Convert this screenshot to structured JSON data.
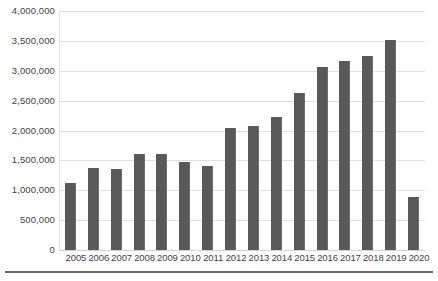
{
  "chart_data": {
    "type": "bar",
    "title": "",
    "subtitle": "",
    "xlabel": "",
    "ylabel": "",
    "categories": [
      "2005",
      "2006",
      "2007",
      "2008",
      "2009",
      "2010",
      "2011",
      "2012",
      "2013",
      "2014",
      "2015",
      "2016",
      "2017",
      "2018",
      "2019",
      "2020"
    ],
    "values": [
      1120000,
      1380000,
      1360000,
      1610000,
      1600000,
      1480000,
      1400000,
      2050000,
      2080000,
      2220000,
      2620000,
      3060000,
      3170000,
      3240000,
      3520000,
      890000
    ],
    "series": [
      {
        "name": "",
        "values": [
          1120000,
          1380000,
          1360000,
          1610000,
          1600000,
          1480000,
          1400000,
          2050000,
          2080000,
          2220000,
          2620000,
          3060000,
          3170000,
          3240000,
          3520000,
          890000
        ]
      }
    ],
    "ylim": [
      0,
      4000000
    ],
    "ytick_values": [
      0,
      500000,
      1000000,
      1500000,
      2000000,
      2500000,
      3000000,
      3500000,
      4000000
    ],
    "ytick_labels": [
      "0",
      "500,000",
      "1,000,000",
      "1,500,000",
      "2,000,000",
      "2,500,000",
      "3,000,000",
      "3,500,000",
      "4,000,000"
    ],
    "grid": true,
    "grid_axis": "y",
    "legend": false,
    "legend_position": "none",
    "bar_color": "#595959",
    "gridline_color": "#e0e0e0",
    "background_color": "#ffffff",
    "text_color": "#3f3f3f",
    "annotations": []
  }
}
